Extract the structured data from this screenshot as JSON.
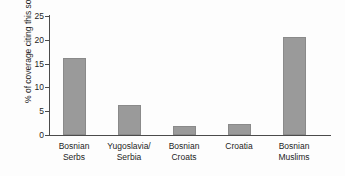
{
  "chart_data": {
    "type": "bar",
    "title": "",
    "subtitle": "",
    "xlabel": "",
    "ylabel": "% of coverage citing this source",
    "categories": [
      "Bosnian\nSerbs",
      "Yugoslavia/\nSerbia",
      "Bosnian\nCroats",
      "Croatia",
      "Bosnian\nMuslims"
    ],
    "values": [
      16.2,
      6.4,
      1.9,
      2.3,
      20.6
    ],
    "ylim": [
      0,
      25
    ],
    "yticks": [
      0,
      5,
      10,
      15,
      20,
      25
    ],
    "ytick_labels": [
      "0",
      "5",
      "10",
      "15",
      "20",
      "25"
    ],
    "grid": false,
    "legend": null,
    "bar_color": "#9a9a9a",
    "axis_color": "#4b4b4b",
    "text_color": "#1d1d1d",
    "background": "#fdfdfd"
  }
}
